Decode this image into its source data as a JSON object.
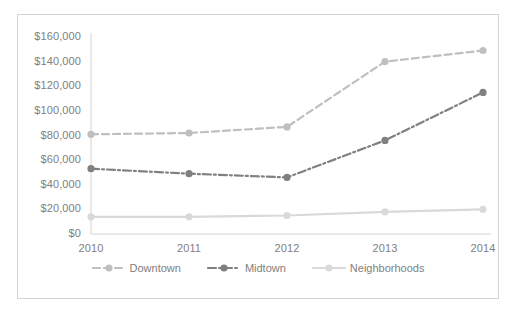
{
  "chart_data": {
    "type": "line",
    "title": "",
    "subtitle": "",
    "xlabel": "",
    "ylabel": "",
    "categories": [
      "2010",
      "2011",
      "2012",
      "2013",
      "2014"
    ],
    "ylim": [
      0,
      160000
    ],
    "ytick_step": 20000,
    "ytick_labels": [
      "$160,000",
      "$140,000",
      "$120,000",
      "$100,000",
      "$80,000",
      "$60,000",
      "$40,000",
      "$20,000",
      "$0"
    ],
    "ytick_values": [
      160000,
      140000,
      120000,
      100000,
      80000,
      60000,
      40000,
      20000,
      0
    ],
    "grid": false,
    "legend_position": "bottom",
    "series": [
      {
        "name": "Downtown",
        "values": [
          81000,
          82000,
          87000,
          140000,
          149000
        ],
        "color": "#bfbfbf",
        "dash": "dashed",
        "marker": "circle"
      },
      {
        "name": "Midtown",
        "values": [
          53000,
          49000,
          46000,
          76000,
          115000
        ],
        "color": "#808080",
        "dash": "dashdot",
        "marker": "circle"
      },
      {
        "name": "Neighborhoods",
        "values": [
          14000,
          14000,
          15000,
          18000,
          20000
        ],
        "color": "#d9d9d9",
        "dash": "solid",
        "marker": "circle"
      }
    ]
  },
  "legend": {
    "items": [
      {
        "label": "Downtown"
      },
      {
        "label": "Midtown"
      },
      {
        "label": "Neighborhoods"
      }
    ]
  },
  "colors": {
    "border": "#d4d4d4",
    "text": "#808080",
    "background": "#ffffff"
  }
}
